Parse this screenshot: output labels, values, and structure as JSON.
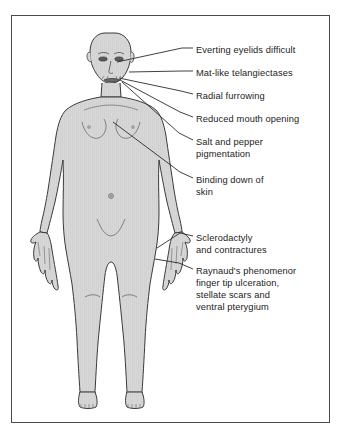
{
  "diagram": {
    "frame_color": "#4a4a4a",
    "body_fill": "#d6d6d6",
    "body_outline": "#3a3a3a",
    "leader_line_color": "#2b2b2b",
    "background": "#ffffff"
  },
  "annotations": [
    {
      "id": "everting-eyelids",
      "lines": [
        "Everting eyelids difficult"
      ],
      "text_x": 196,
      "text_y": 44,
      "leader": {
        "x1": 182,
        "y1": 48,
        "x2": 193,
        "y2": 48
      },
      "pointer": {
        "x1": 117,
        "y1": 62,
        "x2": 182,
        "y2": 48
      },
      "target": "eyelid"
    },
    {
      "id": "mat-like-telangiectases",
      "lines": [
        "Mat-like telangiectases"
      ],
      "text_x": 196,
      "text_y": 67,
      "leader": {
        "x1": 182,
        "y1": 71,
        "x2": 193,
        "y2": 71
      },
      "pointer": {
        "x1": 129,
        "y1": 72,
        "x2": 182,
        "y2": 71
      },
      "target": "cheek"
    },
    {
      "id": "radial-furrowing",
      "lines": [
        "Radial furrowing"
      ],
      "text_x": 196,
      "text_y": 90,
      "leader": {
        "x1": 181,
        "y1": 91,
        "x2": 193,
        "y2": 94
      },
      "pointer": {
        "x1": 119,
        "y1": 78,
        "x2": 181,
        "y2": 91
      },
      "target": "perioral-skin"
    },
    {
      "id": "reduced-mouth-opening",
      "lines": [
        "Reduced mouth opening"
      ],
      "text_x": 196,
      "text_y": 113,
      "leader": {
        "x1": 180,
        "y1": 112,
        "x2": 193,
        "y2": 117
      },
      "pointer": {
        "x1": 120,
        "y1": 80,
        "x2": 180,
        "y2": 112
      },
      "target": "mouth"
    },
    {
      "id": "salt-and-pepper-pigmentation",
      "lines": [
        "Salt and pepper",
        "pigmentation"
      ],
      "text_x": 196,
      "text_y": 136,
      "leader": {
        "x1": 179,
        "y1": 133,
        "x2": 193,
        "y2": 140
      },
      "pointer": {
        "x1": 122,
        "y1": 82,
        "x2": 179,
        "y2": 133
      },
      "target": "face-neck-skin"
    },
    {
      "id": "binding-down-of-skin",
      "lines": [
        "Binding down of",
        "skin"
      ],
      "text_x": 196,
      "text_y": 174,
      "leader": {
        "x1": 180,
        "y1": 172,
        "x2": 193,
        "y2": 178
      },
      "pointer": {
        "x1": 113,
        "y1": 122,
        "x2": 180,
        "y2": 172
      },
      "target": "chest-skin"
    },
    {
      "id": "sclerodactyly-and-contractures",
      "lines": [
        "Sclerodactyly",
        "and contractures"
      ],
      "text_x": 196,
      "text_y": 232,
      "leader": {
        "x1": 180,
        "y1": 233,
        "x2": 193,
        "y2": 236
      },
      "pointer": {
        "x1": 157,
        "y1": 248,
        "x2": 180,
        "y2": 233
      },
      "target": "right-hand"
    },
    {
      "id": "raynauds-phenomenon",
      "lines": [
        "Raynaud's phenomenor",
        "finger tip ulceration,",
        "stellate scars and",
        "ventral pterygium"
      ],
      "text_x": 196,
      "text_y": 265,
      "leader": {
        "x1": 179,
        "y1": 263,
        "x2": 193,
        "y2": 269
      },
      "pointer": {
        "x1": 155,
        "y1": 259,
        "x2": 179,
        "y2": 263
      },
      "target": "right-fingers"
    }
  ]
}
